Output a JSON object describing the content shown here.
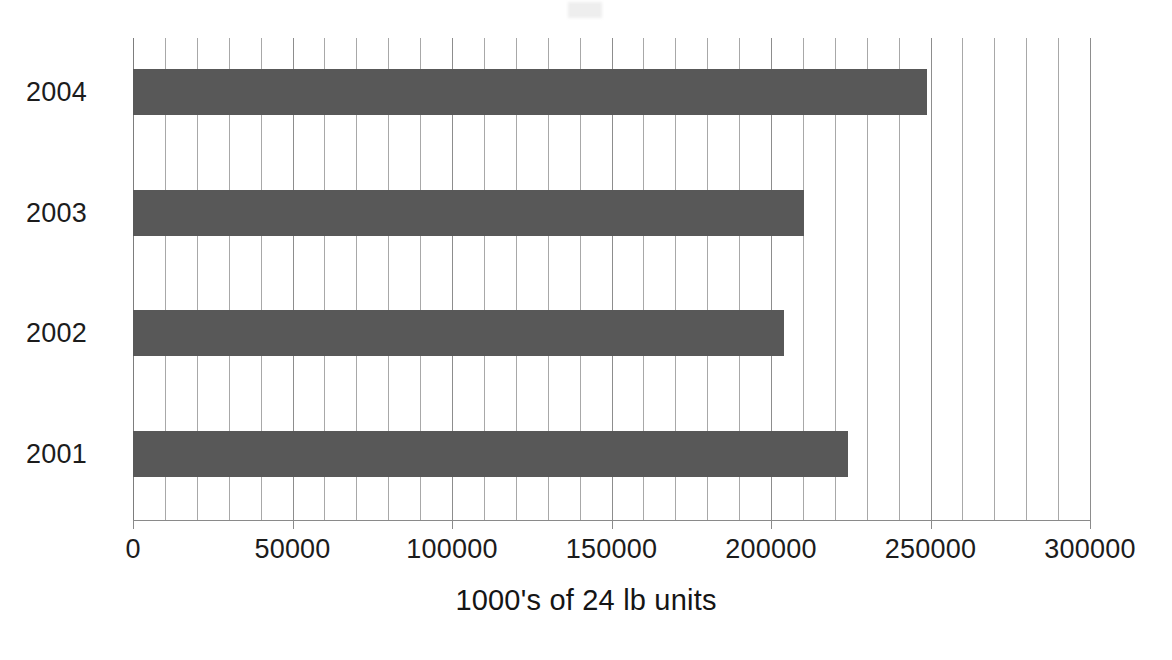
{
  "chart_data": {
    "type": "bar",
    "orientation": "horizontal",
    "title": "",
    "subtitle": "",
    "categories": [
      "2004",
      "2003",
      "2002",
      "2001"
    ],
    "values": [
      249000,
      210500,
      204000,
      224000
    ],
    "series": [
      {
        "name": "units",
        "values": [
          249000,
          210500,
          204000,
          224000
        ]
      }
    ],
    "xlabel": "1000's of 24 lb units",
    "ylabel": "",
    "xlim": [
      0,
      300000
    ],
    "xticks": [
      0,
      50000,
      100000,
      150000,
      200000,
      250000,
      300000
    ],
    "xtick_labels": [
      "0",
      "50000",
      "100000",
      "150000",
      "200000",
      "250000",
      "300000"
    ],
    "minor_tick_step": 10000,
    "grid": true,
    "grid_axis": "x",
    "legend": false,
    "legend_position": "none",
    "bar_color": "#585858",
    "gridline_color": "#9a9a9a",
    "axis_color": "#8a8a8a",
    "background_color": "#ffffff",
    "text_color": "#1c1c1c"
  }
}
